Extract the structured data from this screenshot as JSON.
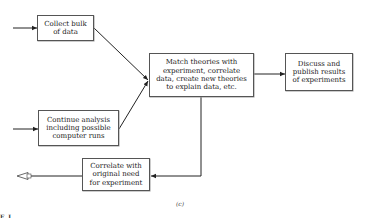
{
  "diagram": {
    "boxes": {
      "collect": {
        "label": "Collect bulk\nof data"
      },
      "continue": {
        "label": "Continue analysis\nincluding possible\ncomputer runs"
      },
      "match": {
        "label": "Match theories with\nexperiment, correlate\ndata, create new theories\nto explain data, etc."
      },
      "discuss": {
        "label": "Discuss and\npublish results\nof experiments"
      },
      "correlate": {
        "label": "Correlate with\noriginal need\nfor experiment"
      }
    },
    "caption": "(c)",
    "partial_text": "F  I  ."
  }
}
